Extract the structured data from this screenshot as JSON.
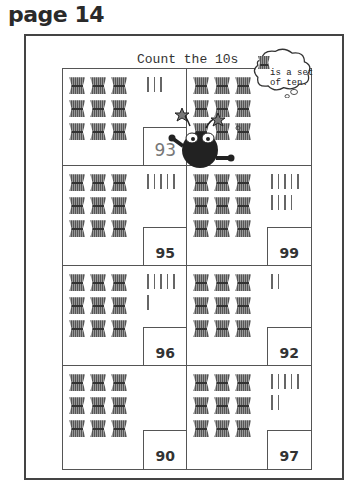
{
  "page": {
    "label": "page 14"
  },
  "worksheet": {
    "title": "Count the 10s",
    "hint": {
      "line1": "is a set",
      "line2": "of ten.",
      "icon": "bundle-of-ten-icon"
    },
    "cells": [
      {
        "tens": 9,
        "ones": 3,
        "answer": "93",
        "answer_style": "handwritten"
      },
      {
        "tens": 9,
        "ones": 0,
        "answer": "",
        "answer_style": "blank",
        "covered_by": "monster-character"
      },
      {
        "tens": 9,
        "ones": 5,
        "answer": "95",
        "answer_style": "printed"
      },
      {
        "tens": 9,
        "ones": 9,
        "answer": "99",
        "answer_style": "printed"
      },
      {
        "tens": 9,
        "ones": 6,
        "answer": "96",
        "answer_style": "printed"
      },
      {
        "tens": 9,
        "ones": 2,
        "answer": "92",
        "answer_style": "printed"
      },
      {
        "tens": 9,
        "ones": 0,
        "answer": "90",
        "answer_style": "printed"
      },
      {
        "tens": 9,
        "ones": 7,
        "answer": "97",
        "answer_style": "printed"
      }
    ]
  }
}
